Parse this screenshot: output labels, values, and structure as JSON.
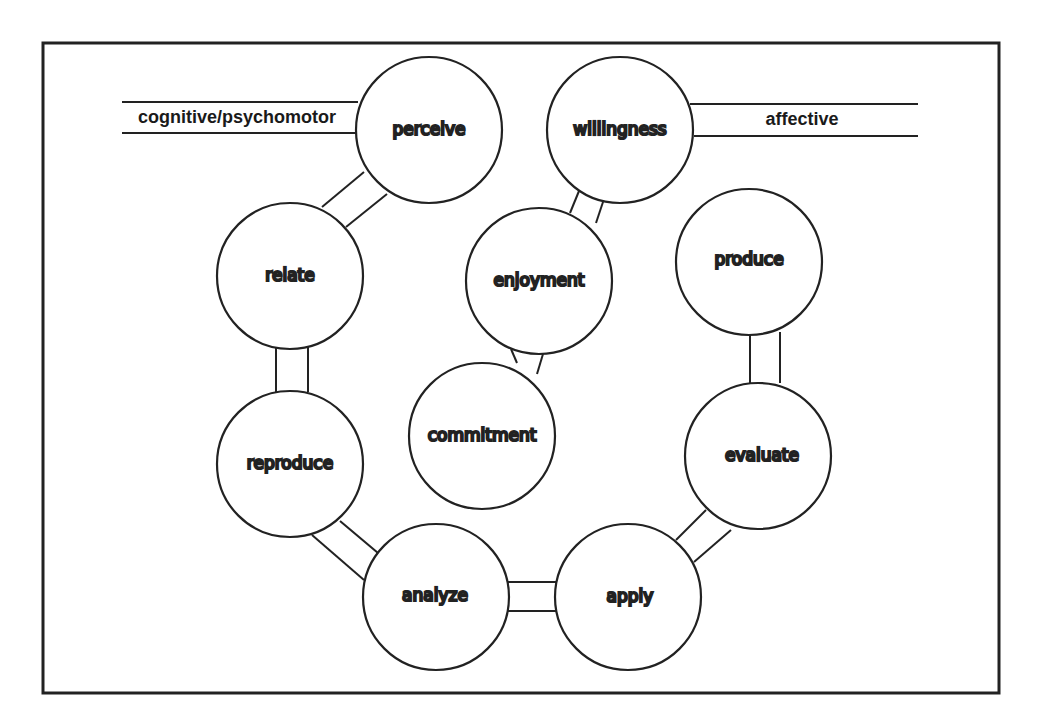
{
  "diagram": {
    "headers": {
      "left": "cognitive/psychomotor",
      "right": "affective"
    },
    "nodes": {
      "perceive": "perceive",
      "willingness": "willingness",
      "relate": "relate",
      "enjoyment": "enjoyment",
      "produce": "produce",
      "commitment": "commitment",
      "reproduce": "reproduce",
      "evaluate": "evaluate",
      "analyze": "analyze",
      "apply": "apply"
    },
    "connections": [
      [
        "perceive",
        "relate"
      ],
      [
        "relate",
        "reproduce"
      ],
      [
        "reproduce",
        "analyze"
      ],
      [
        "analyze",
        "apply"
      ],
      [
        "apply",
        "evaluate"
      ],
      [
        "evaluate",
        "produce"
      ],
      [
        "willingness",
        "enjoyment"
      ],
      [
        "enjoyment",
        "commitment"
      ]
    ]
  }
}
